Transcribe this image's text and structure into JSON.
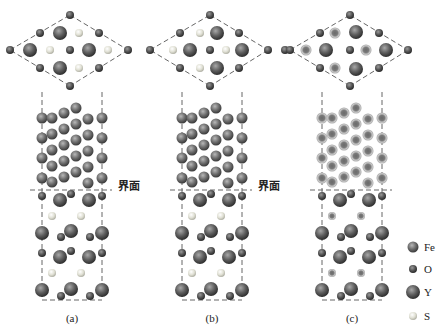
{
  "figure": {
    "panels": [
      {
        "label": "(a)",
        "top_view_inner": "S",
        "ring_style": "normal"
      },
      {
        "label": "(b)",
        "top_view_inner": "S",
        "ring_style": "normal"
      },
      {
        "label": "(c)",
        "top_view_inner": "Y",
        "ring_style": "ringed"
      }
    ],
    "interface_labels": [
      "界面",
      "界面"
    ],
    "legend": [
      {
        "element": "Fe",
        "color": "#6a6a6a",
        "size": "large"
      },
      {
        "element": "O",
        "color": "#555555",
        "size": "small"
      },
      {
        "element": "Y",
        "color": "#5a5a5a",
        "size": "xlarge"
      },
      {
        "element": "S",
        "color": "#d8d8cc",
        "size": "small"
      }
    ]
  }
}
